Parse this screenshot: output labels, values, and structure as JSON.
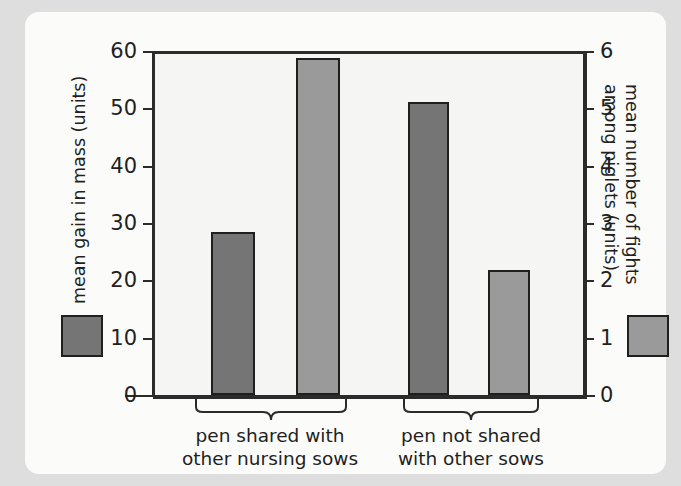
{
  "figure": {
    "background_color": "#dedede",
    "card_color": "#fbfbfa",
    "plot_background": "#f5f5f3",
    "axis_color": "#2b2b2b"
  },
  "chart_data": {
    "type": "bar",
    "title": "",
    "xlabel": "",
    "grid": false,
    "legend_position": "outside-left-and-right",
    "categories": [
      "pen shared with other nursing sows",
      "pen not shared with other sows"
    ],
    "category_lines": [
      [
        "pen shared with",
        "other nursing sows"
      ],
      [
        "pen not shared",
        "with other sows"
      ]
    ],
    "axes": [
      {
        "side": "left",
        "label": "mean gain in mass (units)",
        "ylim": [
          0,
          60
        ],
        "ticks": [
          0,
          10,
          20,
          30,
          40,
          50,
          60
        ],
        "ticklabels": [
          "0",
          "10",
          "20",
          "30",
          "40",
          "50",
          "60"
        ]
      },
      {
        "side": "right",
        "label_line1": "mean number of fights",
        "label_line2": "among piglets (units)",
        "ylim": [
          0,
          6
        ],
        "ticks": [
          0,
          1,
          2,
          3,
          4,
          5,
          6
        ],
        "ticklabels": [
          "0",
          "1",
          "2",
          "3",
          "4",
          "5",
          "6"
        ]
      }
    ],
    "series": [
      {
        "name": "mean gain in mass (units)",
        "axis": "left",
        "color": "#757575",
        "edge_color": "#1f1f1f",
        "values": [
          28.5,
          51.1
        ]
      },
      {
        "name": "mean number of fights among piglets (units)",
        "axis": "right",
        "color": "#9a9a9a",
        "edge_color": "#1f1f1f",
        "values": [
          5.88,
          2.18
        ]
      }
    ],
    "bars": [
      {
        "group": 0,
        "series": 0,
        "value": 28.5,
        "axis": "left",
        "color": "#757575",
        "x": 186,
        "width": 44
      },
      {
        "group": 0,
        "series": 1,
        "value": 5.88,
        "axis": "right",
        "color": "#9a9a9a",
        "x": 271,
        "width": 44
      },
      {
        "group": 1,
        "series": 0,
        "value": 51.1,
        "axis": "left",
        "color": "#757575",
        "x": 383,
        "width": 41
      },
      {
        "group": 1,
        "series": 1,
        "value": 2.18,
        "axis": "right",
        "color": "#9a9a9a",
        "x": 463,
        "width": 42
      }
    ]
  },
  "legend": {
    "left_swatch_color": "#757575",
    "right_swatch_color": "#9a9a9a"
  }
}
